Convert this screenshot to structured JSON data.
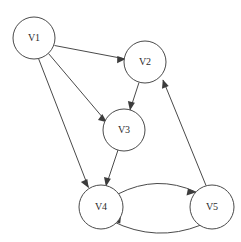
{
  "diagram": {
    "type": "directed-graph",
    "background_color": "#ffffff",
    "stroke_color": "#4a4a4a",
    "label_color": "#2b2b2b",
    "arrow_color": "#3c3c3c",
    "width": 241,
    "height": 242
  },
  "nodes": [
    {
      "id": "v1",
      "label": "V1",
      "cx": 34,
      "cy": 38,
      "r": 21
    },
    {
      "id": "v2",
      "label": "V2",
      "cx": 145,
      "cy": 62,
      "r": 21
    },
    {
      "id": "v3",
      "label": "V3",
      "cx": 124,
      "cy": 130,
      "r": 21
    },
    {
      "id": "v4",
      "label": "V4",
      "cx": 101,
      "cy": 207,
      "r": 22
    },
    {
      "id": "v5",
      "label": "V5",
      "cx": 212,
      "cy": 207,
      "r": 22
    }
  ],
  "edges": [
    {
      "id": "e1",
      "from": "V1",
      "to": "V2",
      "shape": "straight",
      "directed": true
    },
    {
      "id": "e2",
      "from": "V1",
      "to": "V3",
      "shape": "straight",
      "directed": true
    },
    {
      "id": "e3",
      "from": "V1",
      "to": "V4",
      "shape": "straight",
      "directed": true
    },
    {
      "id": "e4",
      "from": "V2",
      "to": "V3",
      "shape": "straight",
      "directed": true
    },
    {
      "id": "e5",
      "from": "V3",
      "to": "V4",
      "shape": "straight",
      "directed": true
    },
    {
      "id": "e6",
      "from": "V4",
      "to": "V5",
      "shape": "curved-upper",
      "directed": true
    },
    {
      "id": "e7",
      "from": "V5",
      "to": "V4",
      "shape": "curved-lower",
      "directed": true
    },
    {
      "id": "e8",
      "from": "V5",
      "to": "V2",
      "shape": "straight",
      "directed": true
    }
  ]
}
